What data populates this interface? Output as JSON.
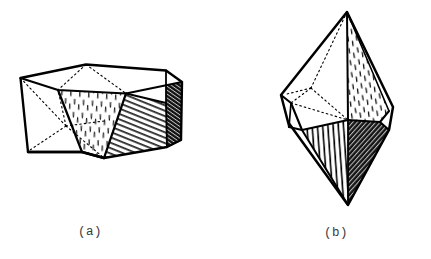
{
  "figure": {
    "kind": "line-drawing",
    "background_color": "#ffffff",
    "ink_color": "#000000",
    "caption_color": "#3a3a3a",
    "panels": [
      {
        "id": "a",
        "caption": "(a)",
        "caption_x": 95,
        "caption_y": 233,
        "description": "squat hexagonal crystal, flat top, stippled front face, diagonally hatched right-front face, dark narrow right side face",
        "faces": [
          {
            "name": "top-basal-face",
            "fill": "white",
            "texture": "none"
          },
          {
            "name": "front-center-face",
            "fill": "white",
            "texture": "vertical-dash-stipple"
          },
          {
            "name": "front-right-face",
            "fill": "white",
            "texture": "diagonal-line-hatch"
          },
          {
            "name": "right-side-face",
            "fill": "dark",
            "texture": "dense-cross-hatch"
          },
          {
            "name": "left-front-face",
            "fill": "white",
            "texture": "none"
          }
        ],
        "hidden_edges": "dotted"
      },
      {
        "id": "b",
        "caption": "(b)",
        "caption_x": 340,
        "caption_y": 234,
        "description": "tall dipyramidal crystal with upper and lower apex, stippled right upper face, vertically hatched lower-front face, dark lower-right face",
        "faces": [
          {
            "name": "upper-left-face",
            "fill": "white",
            "texture": "none"
          },
          {
            "name": "upper-right-face",
            "fill": "white",
            "texture": "vertical-dash-stipple"
          },
          {
            "name": "middle-left-face",
            "fill": "white",
            "texture": "none"
          },
          {
            "name": "lower-front-face",
            "fill": "white",
            "texture": "vertical-line-hatch"
          },
          {
            "name": "lower-right-face",
            "fill": "dark",
            "texture": "dense-cross-hatch"
          },
          {
            "name": "lower-left-face",
            "fill": "white",
            "texture": "none"
          }
        ],
        "hidden_edges": "dotted"
      }
    ]
  }
}
